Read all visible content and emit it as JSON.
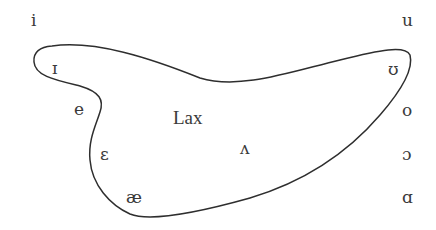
{
  "diagram": {
    "title": "Lax",
    "region": {
      "label": "Lax",
      "members": [
        "ɪ",
        "ʊ",
        "e",
        "ɛ",
        "æ",
        "ʌ"
      ]
    },
    "vowels": {
      "i": "i",
      "u": "u",
      "small_cap_i": "ɪ",
      "upsilon": "ʊ",
      "e": "e",
      "o": "o",
      "open_e": "ɛ",
      "wedge": "ʌ",
      "open_o": "ɔ",
      "ash": "æ",
      "script_a": "ɑ"
    },
    "colors": {
      "ink": "#3a3a3a",
      "stroke": "#2e2e2e",
      "background": "#ffffff"
    }
  }
}
